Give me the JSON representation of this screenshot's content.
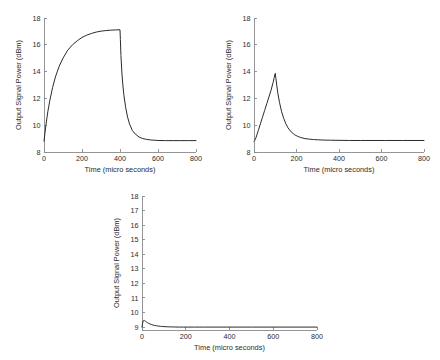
{
  "figure": {
    "background_color": "#ffffff",
    "line_color": "#2b2b2b",
    "axis_color": "#8a8a8a"
  },
  "chart_data": [
    {
      "id": "plot-1",
      "type": "line",
      "title": "",
      "xlabel": "Time (micro seconds)",
      "ylabel": "Output Signal Power (dBm)",
      "xlim": [
        0,
        800
      ],
      "ylim": [
        8,
        18
      ],
      "xticks": [
        0,
        200,
        400,
        600,
        800
      ],
      "yticks": [
        8,
        10,
        12,
        14,
        16,
        18
      ],
      "xtick_labels": [
        "0",
        "200",
        "400",
        "600",
        "800"
      ],
      "ytick_labels": [
        "8",
        "10",
        "12",
        "14",
        "16",
        "18"
      ],
      "grid": false,
      "legend": null,
      "series": [
        {
          "name": "output signal power",
          "x": [
            0,
            5,
            10,
            20,
            30,
            45,
            60,
            80,
            100,
            125,
            150,
            175,
            200,
            225,
            250,
            275,
            300,
            325,
            350,
            375,
            395,
            400,
            402,
            405,
            410,
            415,
            420,
            430,
            440,
            450,
            465,
            480,
            500,
            520,
            540,
            560,
            580,
            600,
            640,
            680,
            720,
            760,
            800
          ],
          "y": [
            8.8,
            9.4,
            10.0,
            11.0,
            11.8,
            12.8,
            13.6,
            14.4,
            15.0,
            15.6,
            16.0,
            16.3,
            16.55,
            16.72,
            16.85,
            16.95,
            17.02,
            17.06,
            17.09,
            17.11,
            17.12,
            17.12,
            16.4,
            15.2,
            13.9,
            13.0,
            12.3,
            11.3,
            10.6,
            10.1,
            9.6,
            9.35,
            9.12,
            9.0,
            8.94,
            8.9,
            8.88,
            8.86,
            8.85,
            8.85,
            8.85,
            8.85,
            8.85
          ]
        }
      ]
    },
    {
      "id": "plot-2",
      "type": "line",
      "title": "",
      "xlabel": "Time (micro seconds)",
      "ylabel": "Output Signal Power (dBm)",
      "xlim": [
        0,
        800
      ],
      "ylim": [
        8,
        18
      ],
      "xticks": [
        0,
        200,
        400,
        600,
        800
      ],
      "yticks": [
        8,
        10,
        12,
        14,
        16,
        18
      ],
      "xtick_labels": [
        "0",
        "200",
        "400",
        "600",
        "800"
      ],
      "ytick_labels": [
        "8",
        "10",
        "12",
        "14",
        "16",
        "18"
      ],
      "grid": false,
      "legend": null,
      "series": [
        {
          "name": "output signal power",
          "x": [
            0,
            3,
            6,
            10,
            15,
            20,
            30,
            40,
            50,
            60,
            70,
            80,
            90,
            95,
            98,
            100,
            103,
            107,
            112,
            120,
            130,
            140,
            150,
            160,
            175,
            190,
            205,
            220,
            240,
            260,
            280,
            300,
            330,
            360,
            400,
            450,
            500,
            560,
            620,
            700,
            800
          ],
          "y": [
            8.8,
            8.85,
            8.95,
            9.1,
            9.35,
            9.6,
            10.1,
            10.6,
            11.1,
            11.6,
            12.1,
            12.6,
            13.2,
            13.55,
            13.78,
            13.87,
            13.5,
            13.0,
            12.4,
            11.7,
            11.0,
            10.5,
            10.1,
            9.8,
            9.5,
            9.3,
            9.17,
            9.08,
            9.0,
            8.96,
            8.93,
            8.91,
            8.89,
            8.88,
            8.87,
            8.86,
            8.86,
            8.86,
            8.86,
            8.86,
            8.86
          ]
        }
      ]
    },
    {
      "id": "plot-3",
      "type": "line",
      "title": "",
      "xlabel": "Time (micro seconds)",
      "ylabel": "Output Signal Power (dBm)",
      "xlim": [
        0,
        800
      ],
      "ylim": [
        8.8,
        18
      ],
      "xticks": [
        0,
        200,
        400,
        600,
        800
      ],
      "yticks": [
        9,
        10,
        11,
        12,
        13,
        14,
        15,
        16,
        17,
        18
      ],
      "xtick_labels": [
        "0",
        "200",
        "400",
        "600",
        "800"
      ],
      "ytick_labels": [
        "9",
        "10",
        "11",
        "12",
        "13",
        "14",
        "15",
        "16",
        "17",
        "18"
      ],
      "grid": false,
      "legend": null,
      "series": [
        {
          "name": "output signal power",
          "x": [
            0,
            2,
            4,
            6,
            8,
            10,
            12,
            15,
            18,
            22,
            26,
            30,
            36,
            42,
            50,
            58,
            66,
            75,
            85,
            95,
            105,
            115,
            125,
            140,
            155,
            170,
            190,
            210,
            240,
            280,
            320,
            400,
            500,
            600,
            700,
            800
          ],
          "y": [
            9.0,
            9.2,
            9.35,
            9.43,
            9.46,
            9.46,
            9.44,
            9.41,
            9.37,
            9.33,
            9.29,
            9.26,
            9.22,
            9.18,
            9.14,
            9.11,
            9.09,
            9.07,
            9.05,
            9.04,
            9.03,
            9.02,
            9.015,
            9.01,
            9.005,
            9.0,
            9.0,
            9.0,
            9.0,
            9.0,
            9.0,
            9.0,
            9.0,
            9.0,
            9.0,
            9.0
          ]
        }
      ]
    }
  ]
}
